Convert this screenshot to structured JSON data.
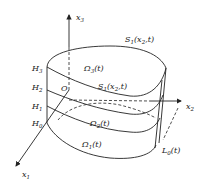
{
  "diagram": {
    "axes": {
      "x1": {
        "label": "x",
        "sub": "1"
      },
      "x2": {
        "label": "x",
        "sub": "2"
      },
      "x3": {
        "label": "x",
        "sub": "3"
      }
    },
    "origin": {
      "label": "O"
    },
    "heights": [
      {
        "label": "H",
        "sub": "0"
      },
      {
        "label": "H",
        "sub": "1"
      },
      {
        "label": "H",
        "sub": "2"
      },
      {
        "label": "H",
        "sub": "3"
      }
    ],
    "regions": [
      {
        "label": "Ω",
        "sub": "1",
        "arg": "(t)"
      },
      {
        "label": "Ω",
        "sub": "2",
        "arg": "(t)"
      },
      {
        "label": "Ω",
        "sub": "3",
        "arg": "(t)"
      }
    ],
    "surfaces": {
      "top": {
        "label": "S",
        "sub": "1",
        "arg": "(x",
        "arg_sub": "2",
        "arg_end": ",t)"
      },
      "inner": {
        "label": "S",
        "sub": "1",
        "arg": "(x",
        "arg_sub": "2",
        "arg_end": ",t)"
      }
    },
    "boundary": {
      "label": "L",
      "sub": "0",
      "arg": "(t)"
    }
  }
}
